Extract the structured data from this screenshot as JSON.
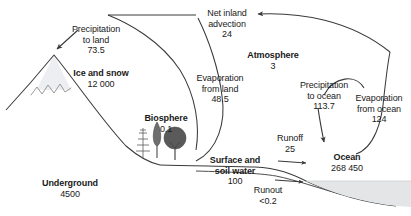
{
  "diagram": {
    "colors": {
      "line": "#3a3a3a",
      "text": "#1a1a1a",
      "ice_fill": "#eceef1",
      "ocean_fill": "#e3e5e7",
      "tree_dark": "#4a4a4a",
      "tree_mid": "#6e6e6e",
      "background": "#ffffff"
    },
    "reservoirs": [
      {
        "id": "ice-and-snow",
        "name": "Ice and snow",
        "value": "12 000"
      },
      {
        "id": "atmosphere",
        "name": "Atmosphere",
        "value": "3"
      },
      {
        "id": "biosphere",
        "name": "Biosphere",
        "value": "0.1"
      },
      {
        "id": "surface-and-soil-water",
        "name": "Surface and soil water",
        "name_line1": "Surface and",
        "name_line2": "soil water",
        "value": "100"
      },
      {
        "id": "underground",
        "name": "Underground",
        "value": "4500"
      },
      {
        "id": "ocean",
        "name": "Ocean",
        "value": "268 450"
      }
    ],
    "fluxes": [
      {
        "id": "precipitation-to-land",
        "name_line1": "Precipitation",
        "name_line2": "to land",
        "value": "73.5"
      },
      {
        "id": "net-inland-advection",
        "name_line1": "Net inland",
        "name_line2": "advection",
        "value": "24"
      },
      {
        "id": "evaporation-from-land",
        "name_line1": "Evaporation",
        "name_line2": "from land",
        "value": "48.5"
      },
      {
        "id": "precipitation-to-ocean",
        "name_line1": "Precipitation",
        "name_line2": "to ocean",
        "value": "113.7"
      },
      {
        "id": "evaporation-from-ocean",
        "name_line1": "Evaporation",
        "name_line2": "from ocean",
        "value": "124"
      },
      {
        "id": "runoff",
        "name_line1": "Runoff",
        "name_line2": "",
        "value": "25"
      },
      {
        "id": "runout",
        "name_line1": "Runout",
        "name_line2": "",
        "value": "<0.2"
      }
    ]
  }
}
